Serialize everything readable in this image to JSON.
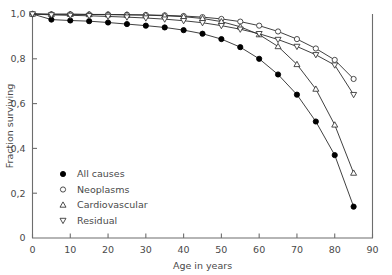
{
  "chart_data": {
    "type": "line",
    "title": "",
    "xlabel": "Age in years",
    "ylabel": "Fraction surviving",
    "xlim": [
      0,
      90
    ],
    "ylim": [
      0,
      1.0
    ],
    "xticks": [
      0,
      10,
      20,
      30,
      40,
      50,
      60,
      70,
      80,
      90
    ],
    "xtick_labels": [
      "0",
      "10",
      "20",
      "30",
      "40",
      "50",
      "60",
      "70",
      "80",
      "90"
    ],
    "yticks": [
      0,
      0.2,
      0.4,
      0.6,
      0.8,
      1.0
    ],
    "ytick_labels": [
      "0",
      "0,2",
      "0,4",
      "0,6",
      "0,8",
      "1,0"
    ],
    "grid": false,
    "legend_position": "lower-left",
    "x": [
      0,
      5,
      10,
      15,
      20,
      25,
      30,
      35,
      40,
      45,
      50,
      55,
      60,
      65,
      70,
      75,
      80,
      85
    ],
    "series": [
      {
        "name": "All causes",
        "marker": "filled-circle",
        "values": [
          1.0,
          0.975,
          0.971,
          0.968,
          0.962,
          0.955,
          0.948,
          0.94,
          0.928,
          0.912,
          0.888,
          0.852,
          0.8,
          0.73,
          0.64,
          0.52,
          0.37,
          0.14
        ]
      },
      {
        "name": "Neoplasms",
        "marker": "open-circle",
        "values": [
          1.0,
          0.999,
          0.999,
          0.998,
          0.998,
          0.997,
          0.996,
          0.994,
          0.991,
          0.986,
          0.978,
          0.966,
          0.948,
          0.922,
          0.888,
          0.846,
          0.795,
          0.71
        ]
      },
      {
        "name": "Cardiovascular",
        "marker": "open-triangle-up",
        "values": [
          1.0,
          0.999,
          0.999,
          0.998,
          0.997,
          0.996,
          0.995,
          0.992,
          0.988,
          0.98,
          0.966,
          0.943,
          0.908,
          0.855,
          0.775,
          0.665,
          0.505,
          0.29
        ]
      },
      {
        "name": "Residual",
        "marker": "open-triangle-down",
        "values": [
          1.0,
          0.996,
          0.994,
          0.992,
          0.989,
          0.986,
          0.982,
          0.977,
          0.97,
          0.961,
          0.948,
          0.932,
          0.912,
          0.886,
          0.855,
          0.818,
          0.772,
          0.64
        ]
      }
    ]
  },
  "legend": {
    "items": [
      {
        "label": "All causes"
      },
      {
        "label": "Neoplasms"
      },
      {
        "label": "Cardiovascular"
      },
      {
        "label": "Residual"
      }
    ]
  }
}
